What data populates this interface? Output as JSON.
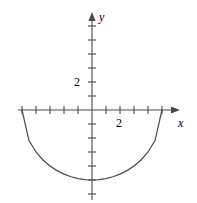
{
  "figure": {
    "kind": "cartesian-plot",
    "width": 197,
    "height": 203,
    "background_color": "#ffffff",
    "ink_color": "#4a4a4a",
    "text_color": "#2b2b2b"
  },
  "axes": {
    "x_axis_label": "x",
    "y_axis_label": "y",
    "x_tick_label": "2",
    "y_tick_label": "2",
    "origin_px": {
      "x": 92,
      "y": 110
    },
    "unit_px": 14,
    "x_axis_extent_px": {
      "start": 18,
      "end": 180
    },
    "y_axis_extent_px": {
      "start": 12,
      "end": 200
    },
    "x_ticks_units": [
      -5,
      -4,
      -3,
      -2,
      -1,
      1,
      2,
      3,
      4,
      5,
      6
    ],
    "y_ticks_units": [
      -6,
      -5,
      -4,
      -3,
      -2,
      -1,
      1,
      2,
      3,
      4,
      5,
      6
    ],
    "arrowheads": [
      "x-positive",
      "y-positive"
    ],
    "grid": false
  },
  "chart_data": {
    "type": "line",
    "title": "",
    "xlabel": "x",
    "ylabel": "y",
    "xlim": [
      -5.3,
      6.3
    ],
    "ylim": [
      -7.0,
      7.0
    ],
    "grid": false,
    "legend": null,
    "series": [
      {
        "name": "lower semicircle",
        "equation": "y = -sqrt(25 - x^2)",
        "shape": "semicircle",
        "center": [
          0,
          0
        ],
        "radius": 5,
        "half": "lower",
        "x_endpoints": [
          -5,
          5
        ],
        "min_point": [
          0,
          -5
        ],
        "x": [
          -5,
          -4.5,
          -4,
          -3.5,
          -3,
          -2.5,
          -2,
          -1.5,
          -1,
          -0.5,
          0,
          0.5,
          1,
          1.5,
          2,
          2.5,
          3,
          3.5,
          4,
          4.5,
          5
        ],
        "y": [
          0,
          -2.18,
          -3,
          -3.57,
          -4,
          -4.33,
          -4.58,
          -4.77,
          -4.9,
          -4.97,
          -5,
          -4.97,
          -4.9,
          -4.77,
          -4.58,
          -4.33,
          -4,
          -3.57,
          -3,
          -2.18,
          0
        ]
      }
    ],
    "annotations": [
      {
        "text": "2",
        "axis": "y",
        "value": 2
      },
      {
        "text": "2",
        "axis": "x",
        "value": 2
      }
    ]
  }
}
